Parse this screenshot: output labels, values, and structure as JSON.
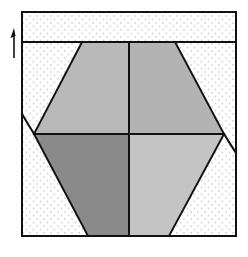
{
  "diagram": {
    "colors": {
      "background": "#ffffff",
      "dot": "#d4d4d4",
      "stroke": "#111111",
      "upper_left": "#b9b9b9",
      "upper_right": "#b3b3b3",
      "lower_left": "#8a8a8a",
      "lower_right": "#c4c4c4"
    },
    "arrow": {
      "direction": "up"
    }
  }
}
